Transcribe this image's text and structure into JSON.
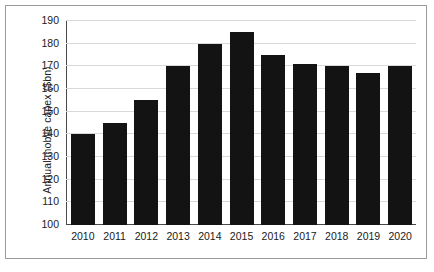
{
  "chart_data": {
    "type": "bar",
    "title": "",
    "xlabel": "",
    "ylabel": "Annual mobile capex ($bn)",
    "categories": [
      "2010",
      "2011",
      "2012",
      "2013",
      "2014",
      "2015",
      "2016",
      "2017",
      "2018",
      "2019",
      "2020"
    ],
    "values": [
      140,
      145,
      155,
      170,
      180,
      185,
      175,
      171,
      170,
      167,
      170
    ],
    "series": [
      {
        "name": "Annual mobile capex",
        "values": [
          140,
          145,
          155,
          170,
          180,
          185,
          175,
          171,
          170,
          167,
          170
        ]
      }
    ],
    "ylim": [
      100,
      190
    ],
    "yticks": [
      100,
      110,
      120,
      130,
      140,
      150,
      160,
      170,
      180,
      190
    ],
    "ytick_labels": [
      "100",
      "110",
      "120",
      "130",
      "140",
      "150",
      "160",
      "170",
      "180",
      "190"
    ],
    "grid": true,
    "legend": "none",
    "bar_color": "#131313",
    "gridline_color": "#d9d9d9",
    "axis_color": "#4a4a4a"
  }
}
